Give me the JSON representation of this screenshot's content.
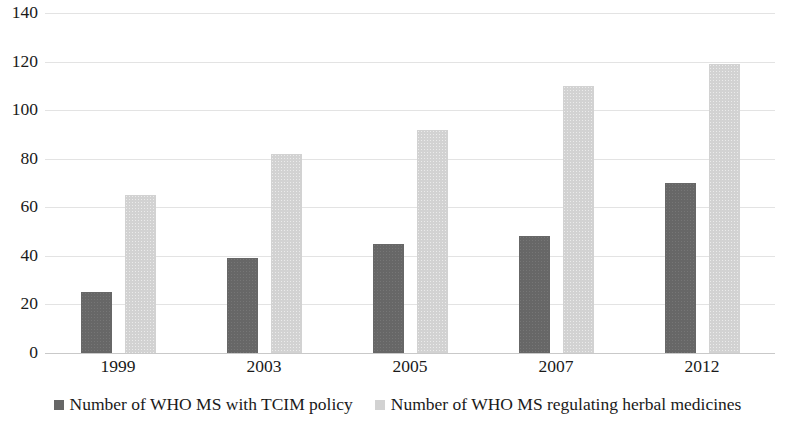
{
  "chart_data": {
    "type": "bar",
    "title": "",
    "subtitle": "",
    "xlabel": "",
    "ylabel": "",
    "categories": [
      "1999",
      "2003",
      "2005",
      "2007",
      "2012"
    ],
    "series": [
      {
        "name": "Number of WHO MS with TCIM policy",
        "color": "#676767",
        "values": [
          25,
          39,
          45,
          48,
          70
        ]
      },
      {
        "name": "Number of WHO MS regulating herbal medicines",
        "color": "#d2d2d2",
        "values": [
          65,
          82,
          92,
          110,
          119
        ]
      }
    ],
    "ylim": [
      0,
      140
    ],
    "ytick_step": 20,
    "yticks": [
      0,
      20,
      40,
      60,
      80,
      100,
      120,
      140
    ],
    "ytick_labels": [
      "0",
      "20",
      "40",
      "60",
      "80",
      "100",
      "120",
      "140"
    ],
    "grid": true,
    "grid_axis": "y",
    "legend_position": "bottom"
  },
  "legend": {
    "items": [
      {
        "label": "Number of WHO MS with TCIM policy",
        "swatch": "legend-swatch-dark"
      },
      {
        "label": "Number of WHO MS regulating herbal medicines",
        "swatch": "legend-swatch-light"
      }
    ]
  },
  "colors": {
    "series_0": "#676767",
    "series_1": "#d2d2d2",
    "gridline": "#e3e3e3",
    "baseline": "#c9c9c9",
    "text": "#1a1a1a",
    "background": "#ffffff"
  }
}
